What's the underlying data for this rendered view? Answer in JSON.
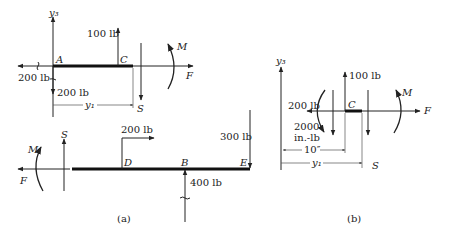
{
  "figure": {
    "caption_a": "(a)",
    "caption_b": "(b)"
  },
  "diagram_a_top": {
    "axis_label": "y₃",
    "point_a": "A",
    "point_c": "C",
    "force_c_up": "100 lb",
    "force_a_left": "200 lb",
    "force_a_down": "200 lb",
    "shear": "S",
    "moment": "M",
    "axial": "F",
    "dimension": "y₁"
  },
  "diagram_a_bottom": {
    "moment": "M",
    "axial": "F",
    "shear": "S",
    "point_d": "D",
    "point_b": "B",
    "point_e": "E",
    "force_d": "200 lb",
    "force_b": "400 lb",
    "force_e": "300 lb"
  },
  "diagram_b": {
    "axis_label": "y₃",
    "point_c": "C",
    "force_c_up": "100 lb",
    "force_left": "200 lb",
    "moment_value_line1": "2000",
    "moment_value_line2": "in.-lb",
    "moment": "M",
    "axial": "F",
    "dimension_10": "10″",
    "dimension_y1": "y₁",
    "shear": "S"
  }
}
